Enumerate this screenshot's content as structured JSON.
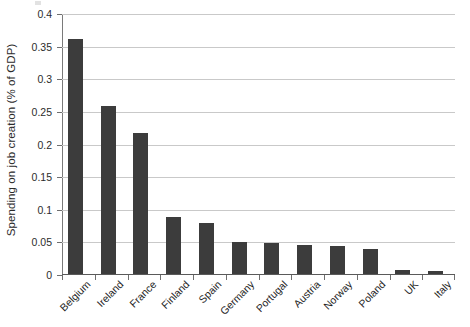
{
  "chart_data": {
    "type": "bar",
    "title": "",
    "xlabel": "",
    "ylabel": "Spending on job creation (% of GDP)",
    "categories": [
      "Belgium",
      "Ireland",
      "France",
      "Finland",
      "Spain",
      "Germany",
      "Portugal",
      "Austria",
      "Norway",
      "Poland",
      "UK",
      "Italy"
    ],
    "values": [
      0.36,
      0.258,
      0.216,
      0.088,
      0.078,
      0.049,
      0.048,
      0.044,
      0.043,
      0.039,
      0.006,
      0.005
    ],
    "ylim": [
      0,
      0.4
    ],
    "yticks": [
      0,
      0.05,
      0.1,
      0.15,
      0.2,
      0.25,
      0.3,
      0.35,
      0.4
    ],
    "ytick_labels": [
      "0",
      "0.05",
      "0.1",
      "0.15",
      "0.2",
      "0.25",
      "0.3",
      "0.35",
      "0.4"
    ],
    "grid": true,
    "legend": false,
    "series_color": "#3c3c3c",
    "gridline_color": "#c9c9c9"
  }
}
